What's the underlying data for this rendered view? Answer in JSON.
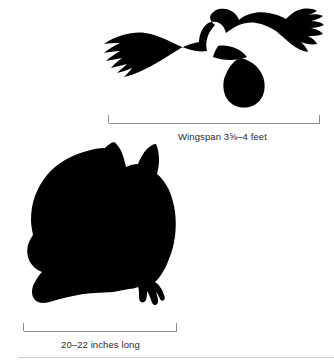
{
  "figure": {
    "name": "great-horned-owl-size-comparison",
    "background_color": "#ffffff",
    "silhouette_color": "#000000",
    "rule_color": "#cfcfcf",
    "caption_color": "#2b2b2b"
  },
  "subjects": [
    {
      "id": "flying-owl",
      "label": "flying owl silhouette",
      "pose": "in flight, wings spread, viewed from below"
    },
    {
      "id": "perched-owl",
      "label": "perched owl silhouette",
      "pose": "perched upright, ear tufts raised, talons gripping"
    }
  ],
  "measurements": [
    {
      "id": "wingspan",
      "caption": "Wingspan 3⅝–4 feet",
      "bracket": "horizontal span bracket with upward end ticks"
    },
    {
      "id": "length",
      "caption": "20–22 inches long",
      "bracket": "horizontal span bracket with upward end ticks"
    }
  ]
}
